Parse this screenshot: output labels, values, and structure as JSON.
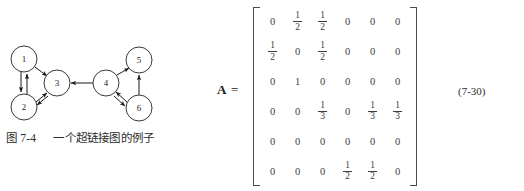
{
  "figure": {
    "caption_label": "图 7-4",
    "caption_text": "一个超链接图的例子",
    "graph": {
      "nodes": [
        {
          "id": "1",
          "label": "1",
          "cx": 24,
          "cy": 33,
          "r": 13
        },
        {
          "id": "2",
          "label": "2",
          "cx": 24,
          "cy": 81,
          "r": 13
        },
        {
          "id": "3",
          "label": "3",
          "cx": 57,
          "cy": 57,
          "r": 13
        },
        {
          "id": "4",
          "label": "4",
          "cx": 106,
          "cy": 57,
          "r": 13
        },
        {
          "id": "5",
          "label": "5",
          "cx": 139,
          "cy": 34,
          "r": 13
        },
        {
          "id": "6",
          "label": "6",
          "cx": 139,
          "cy": 82,
          "r": 13
        }
      ],
      "edges": [
        {
          "from": "1",
          "to": "2",
          "directed": true
        },
        {
          "from": "2",
          "to": "1",
          "directed": true
        },
        {
          "from": "1",
          "to": "3",
          "directed": true
        },
        {
          "from": "2",
          "to": "3",
          "directed": true
        },
        {
          "from": "3",
          "to": "2",
          "directed": true
        },
        {
          "from": "4",
          "to": "3",
          "directed": true
        },
        {
          "from": "4",
          "to": "5",
          "directed": true
        },
        {
          "from": "6",
          "to": "5",
          "directed": true
        },
        {
          "from": "4",
          "to": "6",
          "directed": true
        },
        {
          "from": "6",
          "to": "4",
          "directed": true
        }
      ]
    }
  },
  "equation": {
    "matrix_name": "A",
    "equals": "=",
    "number": "(7-30)",
    "matrix": [
      [
        "0",
        "1/2",
        "1/2",
        "0",
        "0",
        "0"
      ],
      [
        "1/2",
        "0",
        "1/2",
        "0",
        "0",
        "0"
      ],
      [
        "0",
        "1",
        "0",
        "0",
        "0",
        "0"
      ],
      [
        "0",
        "0",
        "1/3",
        "0",
        "1/3",
        "1/3"
      ],
      [
        "0",
        "0",
        "0",
        "0",
        "0",
        "0"
      ],
      [
        "0",
        "0",
        "0",
        "1/2",
        "1/2",
        "0"
      ]
    ]
  },
  "colors": {
    "ink": "#1a1a1a",
    "matrix_ink": "#3c3c3c",
    "bracket": "#4a4a4a",
    "node_stroke": "#3a3a3a",
    "background": "#ffffff"
  }
}
